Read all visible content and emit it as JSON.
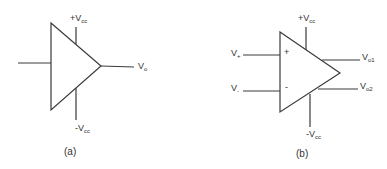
{
  "diagram_a": {
    "caption": "(a)",
    "supply_pos": {
      "prefix": "+V",
      "sub": "cc"
    },
    "supply_neg": {
      "prefix": "-V",
      "sub": "cc"
    },
    "output": {
      "prefix": "V",
      "sub": "o"
    }
  },
  "diagram_b": {
    "caption": "(b)",
    "supply_pos": {
      "prefix": "+V",
      "sub": "cc"
    },
    "supply_neg": {
      "prefix": "-V",
      "sub": "cc"
    },
    "input_pos": {
      "prefix": "V",
      "sub": "+"
    },
    "input_neg": {
      "prefix": "V",
      "sub": "-"
    },
    "plus_sign": "+",
    "minus_sign": "-",
    "output_1": {
      "prefix": "V",
      "sub": "o1"
    },
    "output_2": {
      "prefix": "V",
      "sub": "o2"
    }
  },
  "colors": {
    "line": "#3a3a3a",
    "text": "#333333",
    "background": "#ffffff"
  }
}
